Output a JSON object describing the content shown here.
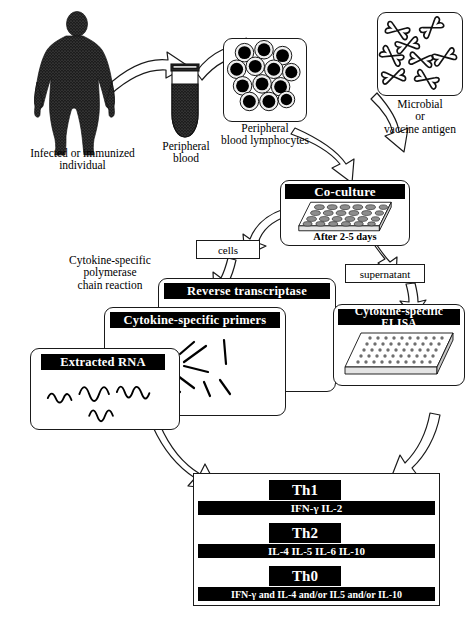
{
  "figure": {
    "ink": "#000000",
    "paper": "#ffffff"
  },
  "steps": {
    "individual": {
      "line1": "Infected or immunized",
      "line2": "individual",
      "icon": "human-body-silhouette-icon"
    },
    "blood": {
      "line1": "Peripheral",
      "line2": "blood",
      "icon": "blood-collection-tube-icon"
    },
    "lymphocytes": {
      "line1": "Peripheral",
      "line2": "blood lymphocytes",
      "icon": "lymphocyte-cells-icon"
    },
    "antigen": {
      "line1": "Microbial",
      "line2": "or",
      "line3": "vaccine antigen",
      "icon": "antigen-particles-icon"
    }
  },
  "coculture": {
    "header": "Co-culture",
    "footer": "After 2-5 days",
    "icon": "24-well-culture-plate-icon"
  },
  "branches": {
    "cells": "cells",
    "supernatant": "supernatant"
  },
  "pcr": {
    "label_line1": "Cytokine-specific",
    "label_line2": "polymerase",
    "label_line3": "chain reaction",
    "cards": [
      {
        "header": "Reverse transcriptase",
        "icon": "enzyme-card-icon"
      },
      {
        "header": "Cytokine-specific primers",
        "icon": "primer-strands-icon"
      },
      {
        "header": "Extracted RNA",
        "icon": "rna-squiggle-icon"
      }
    ]
  },
  "elisa": {
    "header": "Cytokine-specific ELISA",
    "icon": "96-well-elisa-plate-icon"
  },
  "results": {
    "rows": [
      {
        "name": "Th1",
        "cytokines": "IFN-γ   IL-2"
      },
      {
        "name": "Th2",
        "cytokines": "IL-4  IL-5  IL-6  IL-10"
      },
      {
        "name": "Th0",
        "cytokines": "IFN-γ and IL-4 and/or IL5 and/or IL-10"
      }
    ]
  }
}
